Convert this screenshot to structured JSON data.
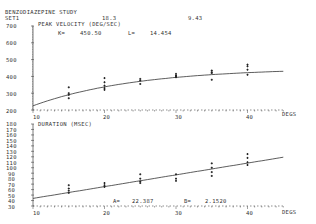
{
  "header": {
    "study": "BENZODIAZEPINE STUDY",
    "set": "SET1",
    "value1": "18.3",
    "value2": "9.43"
  },
  "top_panel": {
    "ylabel": "PEAK VELOCITY (DEG/SEC)",
    "param_k_label": "K=",
    "param_k_value": "450.50",
    "param_l_label": "L=",
    "param_l_value": "14.454",
    "yticks": [
      "700",
      "600",
      "500",
      "400",
      "300",
      "200"
    ],
    "xticks": [
      "10",
      "20",
      "30",
      "40"
    ],
    "xunit": "DEGS"
  },
  "bottom_panel": {
    "ylabel": "DURATION (MSEC)",
    "param_a_label": "A=",
    "param_a_value": "22.387",
    "param_b_label": "B=",
    "param_b_value": "2.1520",
    "yticks": [
      "180",
      "170",
      "160",
      "150",
      "140",
      "130",
      "120",
      "110",
      "100",
      "90",
      "80",
      "70",
      "60",
      "50",
      "40",
      "30"
    ],
    "xticks": [
      "10",
      "20",
      "30",
      "40"
    ],
    "xunit": "DEGS"
  },
  "chart_data": [
    {
      "type": "scatter",
      "title": "PEAK VELOCITY (DEG/SEC)",
      "xlabel": "DEGS",
      "ylabel": "PEAK VELOCITY (DEG/SEC)",
      "xlim": [
        10,
        45
      ],
      "ylim": [
        200,
        700
      ],
      "grid": false,
      "fit": {
        "model": "K*(1-exp(-x/L))",
        "K": 450.5,
        "L": 14.454
      },
      "series": [
        {
          "name": "observations",
          "x": [
            15,
            15,
            15,
            15,
            20,
            20,
            20,
            20,
            20,
            25,
            25,
            25,
            30,
            30,
            30,
            30,
            35,
            35,
            35,
            35,
            40,
            40,
            40,
            40
          ],
          "y": [
            335,
            300,
            290,
            270,
            390,
            365,
            345,
            330,
            320,
            385,
            375,
            355,
            415,
            405,
            400,
            395,
            435,
            425,
            420,
            380,
            470,
            460,
            440,
            410
          ]
        }
      ],
      "annotations": [
        "K= 450.50",
        "L= 14.454"
      ]
    },
    {
      "type": "scatter",
      "title": "DURATION (MSEC)",
      "xlabel": "DEGS",
      "ylabel": "DURATION (MSEC)",
      "xlim": [
        10,
        45
      ],
      "ylim": [
        30,
        180
      ],
      "grid": false,
      "fit": {
        "model": "A+B*x",
        "A": 22.387,
        "B": 2.152
      },
      "series": [
        {
          "name": "observations",
          "x": [
            15,
            15,
            15,
            15,
            20,
            20,
            20,
            25,
            25,
            25,
            25,
            30,
            30,
            30,
            35,
            35,
            35,
            35,
            40,
            40,
            40,
            40
          ],
          "y": [
            68,
            62,
            58,
            54,
            72,
            68,
            65,
            88,
            80,
            75,
            72,
            88,
            80,
            76,
            108,
            100,
            92,
            85,
            125,
            118,
            110,
            105
          ]
        }
      ],
      "annotations": [
        "A= 22.387",
        "B= 2.1520"
      ]
    }
  ]
}
